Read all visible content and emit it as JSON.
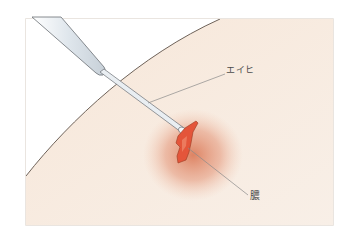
{
  "figure": {
    "type": "medical-illustration",
    "colors": {
      "frame_border": "#e3ddd6",
      "background": "#ffffff",
      "skin": "#f6e8dc",
      "skin_edge": "#6e6259",
      "inflammation": "#e08a6a",
      "pus": "#e4553a",
      "instrument": "#e9eef2",
      "instrument_edge": "#6a6f74",
      "leader_line": "#8a8a8a"
    }
  },
  "labels": {
    "instrument": "エイヒ",
    "pus": "膿"
  }
}
